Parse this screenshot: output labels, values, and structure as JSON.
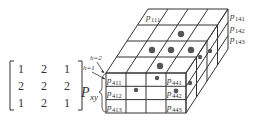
{
  "matrix": {
    "rows": [
      [
        "1",
        "2",
        "1"
      ],
      [
        "2",
        "2",
        "2"
      ],
      [
        "1",
        "2",
        "1"
      ]
    ]
  },
  "labels": {
    "h2": "h=2",
    "h1": "h=1",
    "pxy_main": "P",
    "pxy_sub": "xy",
    "cells": {
      "p111": {
        "main": "p",
        "sub": "111"
      },
      "p141": {
        "main": "p",
        "sub": "141"
      },
      "p142": {
        "main": "p",
        "sub": "142"
      },
      "p143": {
        "main": "p",
        "sub": "143"
      },
      "p411": {
        "main": "p",
        "sub": "411"
      },
      "p412": {
        "main": "p",
        "sub": "412"
      },
      "p413": {
        "main": "p",
        "sub": "413"
      },
      "p441": {
        "main": "p",
        "sub": "441"
      },
      "p442": {
        "main": "p",
        "sub": "442"
      },
      "p443": {
        "main": "p",
        "sub": "443"
      }
    }
  },
  "colors": {
    "line": "#333333",
    "dot": "#555555"
  }
}
